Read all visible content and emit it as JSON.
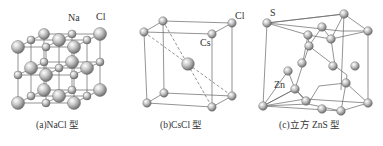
{
  "figure": {
    "panels": [
      {
        "id": "a",
        "caption": "(a)NaCl 型",
        "labels": {
          "na": "Na",
          "cl": "Cl"
        },
        "structure": "NaCl rock-salt lattice"
      },
      {
        "id": "b",
        "caption": "(b)CsCl 型",
        "labels": {
          "cl": "Cl",
          "cs": "Cs"
        },
        "structure": "CsCl body-centered lattice"
      },
      {
        "id": "c",
        "caption": "(c)立方 ZnS 型",
        "labels": {
          "s": "S",
          "zn": "Zn"
        },
        "structure": "Cubic ZnS zinc blende lattice"
      }
    ]
  },
  "colors": {
    "line": "#555555",
    "sphere_light": "#f2f2f2",
    "sphere_dark": "#7a7a7a",
    "text": "#333333"
  }
}
